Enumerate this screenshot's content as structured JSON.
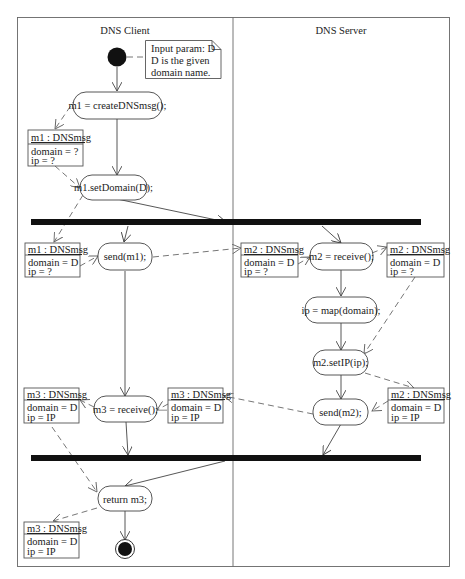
{
  "diagram": {
    "type": "UML activity diagram",
    "swimlanes": [
      {
        "id": "client",
        "label": "DNS Client"
      },
      {
        "id": "server",
        "label": "DNS Server"
      }
    ],
    "note": {
      "lines": [
        "Input param: D",
        "D is the given",
        "domain name."
      ]
    },
    "actions": {
      "create": "m1 = createDNSmsg();",
      "setDomain": "m1.setDomain(D);",
      "send1": "send(m1);",
      "receive2": "m2 = receive();",
      "map": "ip = map(domain);",
      "setIP": "m2.setIP(ip);",
      "send2": "send(m2);",
      "receive3": "m3 = receive();",
      "return": "return m3;"
    },
    "objects": {
      "o1": {
        "title": "m1 : DNSmsg",
        "attr1": "domain = ?",
        "attr2": "ip = ?"
      },
      "o2": {
        "title": "m1 : DNSmsg",
        "attr1": "domain = D",
        "attr2": "ip = ?"
      },
      "o3": {
        "title": "m2 : DNSmsg",
        "attr1": "domain = D",
        "attr2": "ip = ?"
      },
      "o4": {
        "title": "m2 : DNSmsg",
        "attr1": "domain = D",
        "attr2": "ip = ?"
      },
      "o5": {
        "title": "m2 : DNSmsg",
        "attr1": "domain = D",
        "attr2": "ip = IP"
      },
      "o6": {
        "title": "m3 : DNSmsg",
        "attr1": "domain = D",
        "attr2": "ip = IP"
      },
      "o7": {
        "title": "m3 : DNSmsg",
        "attr1": "domain = D",
        "attr2": "ip = IP"
      },
      "o8": {
        "title": "m3 : DNSmsg",
        "attr1": "domain = D",
        "attr2": "ip = IP"
      }
    }
  }
}
